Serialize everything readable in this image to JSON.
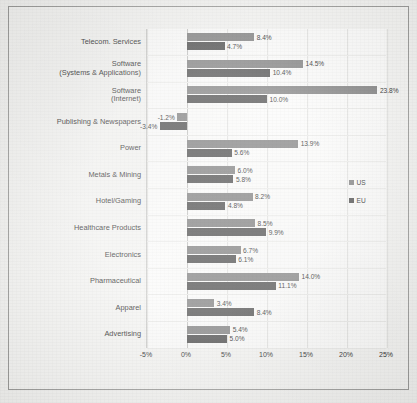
{
  "chart_data": {
    "type": "bar",
    "orientation": "horizontal",
    "title": "",
    "xlabel": "",
    "ylabel": "",
    "xlim": [
      -5,
      25
    ],
    "xticks": [
      "-5%",
      "0%",
      "5%",
      "10%",
      "15%",
      "20%",
      "25%"
    ],
    "xtick_values": [
      -5,
      0,
      5,
      10,
      15,
      20,
      25
    ],
    "grid": true,
    "legend_position": "inside-right",
    "categories": [
      "Telecom. Services",
      "Software\n(Systems & Applications)",
      "Software\n(Internet)",
      "Publishing & Newspapers",
      "Power",
      "Metals & Mining",
      "Hotel/Gaming",
      "Healthcare Products",
      "Electronics",
      "Pharmaceutical",
      "Apparel",
      "Advertising"
    ],
    "series": [
      {
        "name": "US",
        "color": "#7e7e7e",
        "values": [
          8.4,
          14.5,
          23.8,
          -1.2,
          13.9,
          6.0,
          8.2,
          8.5,
          6.7,
          14.0,
          3.4,
          5.4
        ],
        "labels": [
          "8.4%",
          "14.5%",
          "23.8%",
          "-1.2%",
          "13.9%",
          "6.0%",
          "8.2%",
          "8.5%",
          "6.7%",
          "14.0%",
          "3.4%",
          "5.4%"
        ]
      },
      {
        "name": "EU",
        "color": "#4a4a4a",
        "values": [
          4.7,
          10.4,
          10.0,
          -3.4,
          5.6,
          5.8,
          4.8,
          9.9,
          6.1,
          11.1,
          8.4,
          5.0
        ],
        "labels": [
          "4.7%",
          "10.4%",
          "10.0%",
          "-3.4%",
          "5.6%",
          "5.8%",
          "4.8%",
          "9.9%",
          "6.1%",
          "11.1%",
          "8.4%",
          "5.0%"
        ]
      }
    ]
  },
  "legend": {
    "items": [
      {
        "label": "US"
      },
      {
        "label": "EU"
      }
    ]
  }
}
